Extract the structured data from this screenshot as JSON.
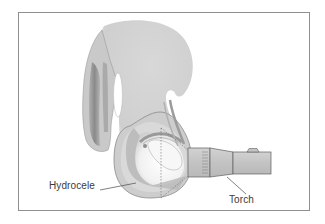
{
  "figure": {
    "labels": {
      "hydrocele": "Hydrocele",
      "torch": "Torch"
    },
    "colors": {
      "frame_border": "#8f8f8f",
      "tissue_light": "#d4d4d4",
      "tissue_mid": "#bdbdbd",
      "tissue_dark": "#8e8e8e",
      "illuminated": "#f4f4f4",
      "torch_body": "#c8c8c8",
      "outline": "#5a5a5a",
      "label_text": "#3a3a3a"
    }
  }
}
